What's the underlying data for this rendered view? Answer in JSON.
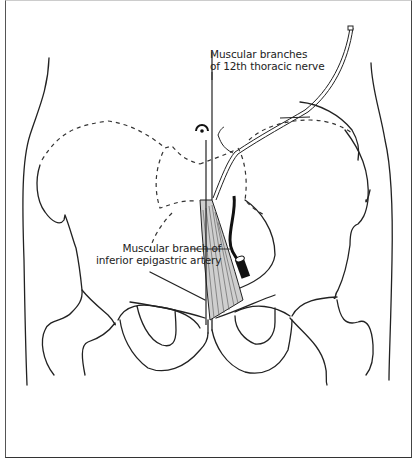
{
  "figure": {
    "labels": {
      "nerve_line1": "Muscular branches",
      "nerve_line2": "of 12th thoracic nerve",
      "artery_line1": "Muscular branch of",
      "artery_line2": "inferior epigastric artery"
    },
    "colors": {
      "ink": "#222222",
      "background": "#ffffff",
      "frame": "#444444"
    }
  }
}
